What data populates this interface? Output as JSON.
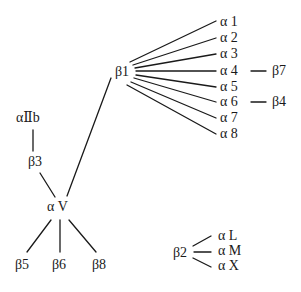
{
  "diagram": {
    "nodes": {
      "b1": {
        "label": "β1",
        "x": 115,
        "y": 64
      },
      "a1": {
        "label": "α 1",
        "x": 220,
        "y": 14
      },
      "a2": {
        "label": "α 2",
        "x": 220,
        "y": 30
      },
      "a3": {
        "label": "α 3",
        "x": 220,
        "y": 46
      },
      "a4": {
        "label": "α 4",
        "x": 220,
        "y": 63
      },
      "a5": {
        "label": "α 5",
        "x": 220,
        "y": 79
      },
      "a6": {
        "label": "α 6",
        "x": 220,
        "y": 94
      },
      "a7": {
        "label": "α 7",
        "x": 220,
        "y": 110
      },
      "a8": {
        "label": "α 8",
        "x": 220,
        "y": 126
      },
      "b7": {
        "label": "β7",
        "x": 272,
        "y": 63
      },
      "b4": {
        "label": "β4",
        "x": 272,
        "y": 94
      },
      "aIIb": {
        "label": "αⅡb",
        "x": 16,
        "y": 110
      },
      "b3": {
        "label": "β3",
        "x": 28,
        "y": 154
      },
      "aV": {
        "label": "α V",
        "x": 47,
        "y": 199
      },
      "b5": {
        "label": "β5",
        "x": 15,
        "y": 257
      },
      "b6": {
        "label": "β6",
        "x": 52,
        "y": 257
      },
      "b8": {
        "label": "β8",
        "x": 92,
        "y": 257
      },
      "b2": {
        "label": "β2",
        "x": 173,
        "y": 245
      },
      "aL": {
        "label": "α L",
        "x": 218,
        "y": 228
      },
      "aM": {
        "label": "α M",
        "x": 218,
        "y": 243
      },
      "aX": {
        "label": "α X",
        "x": 218,
        "y": 258
      }
    },
    "edges": [
      {
        "from": "b1",
        "to": "a1",
        "x1": 130,
        "y1": 62,
        "x2": 216,
        "y2": 21
      },
      {
        "from": "b1",
        "to": "a2",
        "x1": 133,
        "y1": 65,
        "x2": 216,
        "y2": 38
      },
      {
        "from": "b1",
        "to": "a3",
        "x1": 135,
        "y1": 68,
        "x2": 216,
        "y2": 54
      },
      {
        "from": "b1",
        "to": "a4",
        "x1": 136,
        "y1": 71,
        "x2": 216,
        "y2": 71
      },
      {
        "from": "b1",
        "to": "a5",
        "x1": 136,
        "y1": 75,
        "x2": 216,
        "y2": 87
      },
      {
        "from": "b1",
        "to": "a6",
        "x1": 134,
        "y1": 78,
        "x2": 216,
        "y2": 102
      },
      {
        "from": "b1",
        "to": "a7",
        "x1": 131,
        "y1": 82,
        "x2": 216,
        "y2": 118
      },
      {
        "from": "b1",
        "to": "a8",
        "x1": 127,
        "y1": 85,
        "x2": 216,
        "y2": 134
      },
      {
        "from": "a4",
        "to": "b7",
        "x1": 251,
        "y1": 71,
        "x2": 266,
        "y2": 71
      },
      {
        "from": "a6",
        "to": "b4",
        "x1": 251,
        "y1": 102,
        "x2": 266,
        "y2": 102
      },
      {
        "from": "b1",
        "to": "aV",
        "x1": 111,
        "y1": 78,
        "x2": 67,
        "y2": 196
      },
      {
        "from": "aIIb",
        "to": "b3",
        "x1": 33,
        "y1": 130,
        "x2": 33,
        "y2": 151
      },
      {
        "from": "b3",
        "to": "aV",
        "x1": 40,
        "y1": 173,
        "x2": 55,
        "y2": 197
      },
      {
        "from": "aV",
        "to": "b5",
        "x1": 51,
        "y1": 220,
        "x2": 27,
        "y2": 252
      },
      {
        "from": "aV",
        "to": "b6",
        "x1": 60,
        "y1": 220,
        "x2": 60,
        "y2": 252
      },
      {
        "from": "aV",
        "to": "b8",
        "x1": 69,
        "y1": 220,
        "x2": 96,
        "y2": 252
      },
      {
        "from": "b2",
        "to": "aL",
        "x1": 193,
        "y1": 246,
        "x2": 211,
        "y2": 236
      },
      {
        "from": "b2",
        "to": "aM",
        "x1": 194,
        "y1": 252,
        "x2": 211,
        "y2": 252
      },
      {
        "from": "b2",
        "to": "aX",
        "x1": 193,
        "y1": 258,
        "x2": 211,
        "y2": 267
      }
    ]
  }
}
